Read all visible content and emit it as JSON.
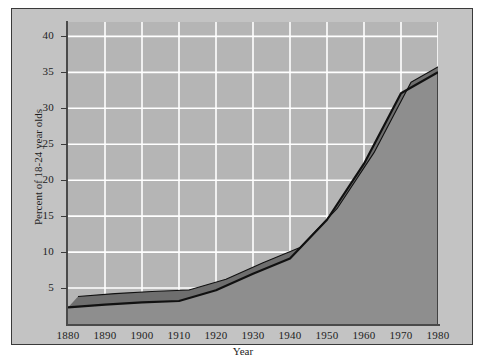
{
  "chart_data": {
    "type": "area",
    "title": "",
    "xlabel": "Year",
    "ylabel": "Percent of 18-24 year olds",
    "x": [
      1880,
      1890,
      1900,
      1910,
      1920,
      1930,
      1940,
      1950,
      1960,
      1970,
      1980
    ],
    "values": [
      2.3,
      2.7,
      3.0,
      3.2,
      4.7,
      7.0,
      9.1,
      14.5,
      22.3,
      32.1,
      35.0
    ],
    "series": [
      {
        "name": "Percent of 18-24 year olds enrolled",
        "values": [
          2.3,
          2.7,
          3.0,
          3.2,
          4.7,
          7.0,
          9.1,
          14.5,
          22.3,
          32.1,
          35.0
        ]
      }
    ],
    "xlim": [
      1880,
      1980
    ],
    "ylim": [
      0,
      42
    ],
    "yticks": [
      5,
      10,
      15,
      20,
      25,
      30,
      35,
      40
    ],
    "ytick_labels": [
      "5",
      "10",
      "15",
      "20",
      "25",
      "30",
      "35",
      "40"
    ],
    "xticks": [
      1880,
      1890,
      1900,
      1910,
      1920,
      1930,
      1940,
      1950,
      1960,
      1970,
      1980
    ],
    "xtick_labels": [
      "1880",
      "1890",
      "1900",
      "1910",
      "1920",
      "1930",
      "1940",
      "1950",
      "1960",
      "1970",
      "1980"
    ],
    "grid": true,
    "grid_color": "#ffffff",
    "legend": false,
    "legend_position": "none",
    "style": "3d-extruded-area",
    "colors": {
      "plot_background": "#b5b5b5",
      "panel_background": "#c3c3c3",
      "area_fill": "#8e8e8e",
      "area_top_face": "#6e6e6e",
      "area_side_face": "#7d7d7d",
      "line": "#111111",
      "axis": "#4a4a4a",
      "text": "#1d1d1d"
    }
  }
}
